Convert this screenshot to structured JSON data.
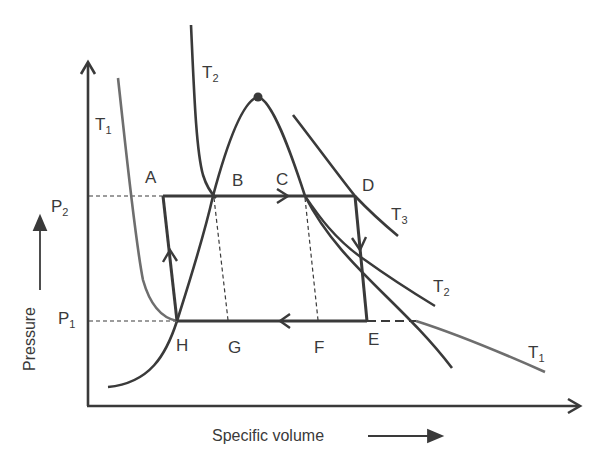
{
  "diagram": {
    "type": "thermodynamic P-v diagram (vapor compression / heat pump cycle)",
    "axes": {
      "x_label": "Specific volume",
      "y_label": "Pressure"
    },
    "pressure_levels": [
      {
        "name": "P",
        "sub": "2",
        "meaning": "high pressure"
      },
      {
        "name": "P",
        "sub": "1",
        "meaning": "low pressure"
      }
    ],
    "isotherms": [
      {
        "name": "T",
        "sub": "1",
        "position": "left and lower-right"
      },
      {
        "name": "T",
        "sub": "2",
        "position": "upper-left and middle-right"
      },
      {
        "name": "T",
        "sub": "3",
        "position": "upper-right"
      }
    ],
    "points": {
      "A": "A",
      "B": "B",
      "C": "C",
      "D": "D",
      "E": "E",
      "F": "F",
      "G": "G",
      "H": "H"
    },
    "cycle_path": [
      "H",
      "A",
      "D",
      "E",
      "H"
    ],
    "features": [
      "saturation dome with critical point",
      "dashed lines B-G and C-F",
      "dashed extension beyond E along P1"
    ]
  },
  "labels": {
    "T1_left": {
      "main": "T",
      "sub": "1"
    },
    "T2_top": {
      "main": "T",
      "sub": "2"
    },
    "T3": {
      "main": "T",
      "sub": "3"
    },
    "T2_right": {
      "main": "T",
      "sub": "2"
    },
    "T1_right": {
      "main": "T",
      "sub": "1"
    },
    "P2": {
      "main": "P",
      "sub": "2"
    },
    "P1": {
      "main": "P",
      "sub": "1"
    },
    "A": "A",
    "B": "B",
    "C": "C",
    "D": "D",
    "E": "E",
    "F": "F",
    "G": "G",
    "H": "H",
    "x_axis": "Specific volume",
    "y_axis": "Pressure"
  },
  "colors": {
    "ink": "#3a3a3a",
    "isotherm_t1": "#6e6e6e",
    "background": "#ffffff"
  }
}
